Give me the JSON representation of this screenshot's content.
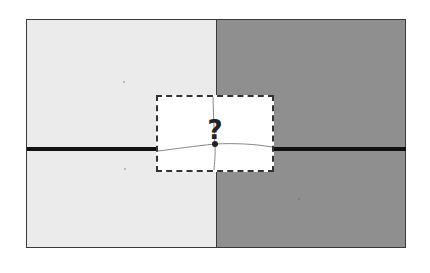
{
  "diagram": {
    "colors": {
      "left_region": "#ebebeb",
      "right_region": "#8f8f8f",
      "boundary_line": "#111111",
      "frame": "#3a3a3a",
      "inset_background": "#ffffff",
      "inset_border": "#333333",
      "thin_lines": "#888888"
    },
    "inset": {
      "label": "?"
    }
  }
}
